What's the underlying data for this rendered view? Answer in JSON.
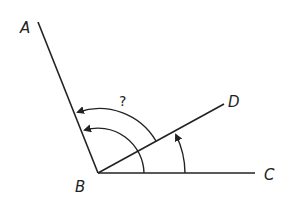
{
  "diagram": {
    "type": "angle-diagram",
    "stroke_color": "#222222",
    "background": "#ffffff",
    "points": {
      "A": {
        "label": "A"
      },
      "B": {
        "label": "B"
      },
      "C": {
        "label": "C"
      },
      "D": {
        "label": "D"
      }
    },
    "rays": [
      "BA",
      "BD",
      "BC"
    ],
    "arcs": [
      {
        "name": "angle-CBD",
        "from": "BC",
        "to": "BD",
        "label": ""
      },
      {
        "name": "angle-DBA",
        "from": "BD",
        "to": "BA",
        "label": ""
      },
      {
        "name": "angle-CBA",
        "from": "BD",
        "to": "BA",
        "label": "?"
      }
    ],
    "unknown_label": "?"
  }
}
